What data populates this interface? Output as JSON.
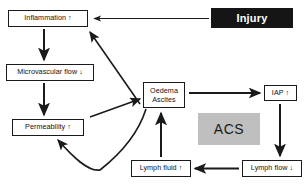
{
  "diagram": {
    "title_banner": {
      "label": "Injury"
    },
    "highlight": {
      "label": "ACS"
    },
    "nodes": {
      "inflammation": {
        "label": "Inflammation ↑"
      },
      "microvascular": {
        "label": "Microvascular flow ↓"
      },
      "permeability": {
        "label": "Permeability ↑"
      },
      "oedema_line1": "Oedema",
      "oedema_line2": "Ascites",
      "iap": {
        "label": "IAP ↑"
      },
      "lymph_fluid": {
        "label": "Lymph fluid ↑"
      },
      "lymph_flow": {
        "label": "Lymph flow ↓"
      }
    },
    "colors": {
      "banner_background": "#151515",
      "banner_text": "#ffffff",
      "highlight_background": "#bfbfbf",
      "line": "#1a1a1a",
      "box_border": "#1a1a1a",
      "page_background": "#ffffff"
    }
  }
}
